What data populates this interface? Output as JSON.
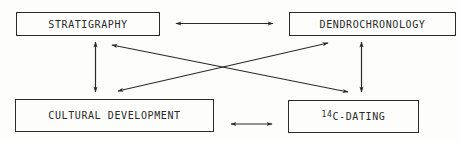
{
  "diagram": {
    "nodes": [
      {
        "id": "stratigraphy",
        "label": "STRATIGRAPHY"
      },
      {
        "id": "dendrochronology",
        "label": "DENDROCHRONOLOGY"
      },
      {
        "id": "cultural_development",
        "label": "CULTURAL DEVELOPMENT"
      },
      {
        "id": "c14_dating",
        "label_sup": "14",
        "label": "C-DATING"
      }
    ],
    "edges": [
      {
        "from": "stratigraphy",
        "to": "dendrochronology",
        "type": "bidirectional"
      },
      {
        "from": "stratigraphy",
        "to": "cultural_development",
        "type": "bidirectional"
      },
      {
        "from": "dendrochronology",
        "to": "c14_dating",
        "type": "bidirectional"
      },
      {
        "from": "cultural_development",
        "to": "c14_dating",
        "type": "bidirectional"
      },
      {
        "from": "stratigraphy",
        "to": "c14_dating",
        "type": "bidirectional"
      },
      {
        "from": "cultural_development",
        "to": "dendrochronology",
        "type": "bidirectional"
      }
    ],
    "colors": {
      "line": "#2a2a2a",
      "background": "#fdfdfb"
    }
  }
}
